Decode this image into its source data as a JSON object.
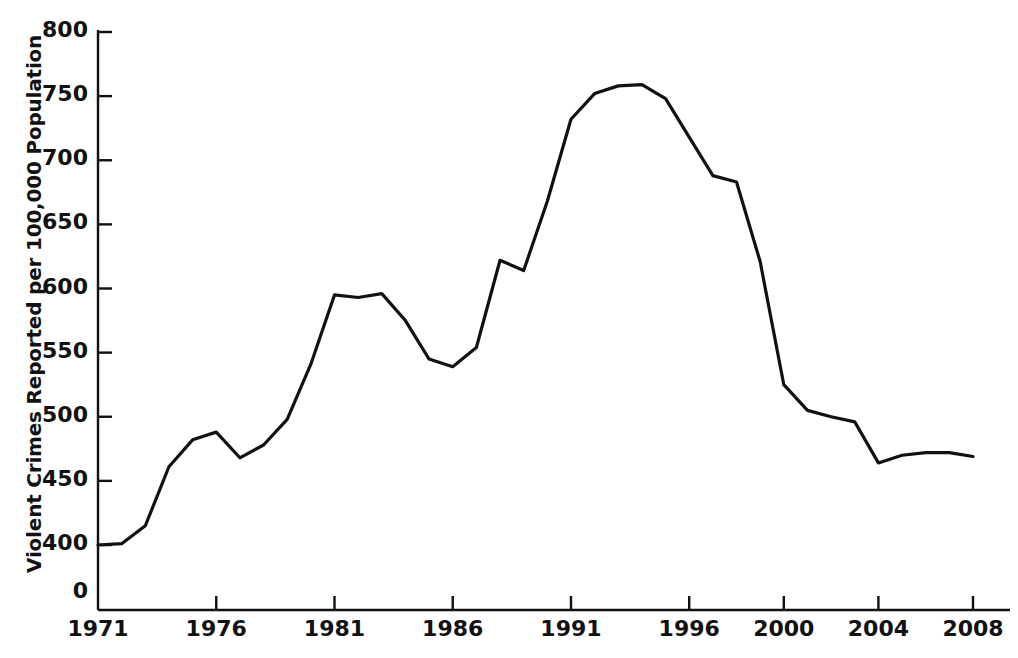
{
  "chart_data": {
    "type": "line",
    "title": "",
    "subtitle": "",
    "xlabel": "",
    "ylabel": "Violent Crimes Reported per 100,000 Population",
    "xlim": [
      1971,
      2008
    ],
    "ylim": [
      400,
      800
    ],
    "y_axis_has_zero_break": true,
    "y_zero_label": "0",
    "yticks": [
      400,
      450,
      500,
      550,
      600,
      650,
      700,
      750,
      800
    ],
    "ytick_labels": [
      "400",
      "450",
      "500",
      "550",
      "600",
      "650",
      "700",
      "750",
      "800"
    ],
    "xticks": [
      1971,
      1976,
      1981,
      1986,
      1991,
      1996,
      2000,
      2004,
      2008
    ],
    "xtick_labels": [
      "1971",
      "1976",
      "1981",
      "1986",
      "1991",
      "1996",
      "2000",
      "2004",
      "2008"
    ],
    "grid": false,
    "legend": false,
    "legend_position": "none",
    "line_color": "#111111",
    "line_width": 3.2,
    "axis_color": "#111111",
    "background_color": "#ffffff",
    "x": [
      1971,
      1972,
      1973,
      1974,
      1975,
      1976,
      1977,
      1978,
      1979,
      1980,
      1981,
      1982,
      1983,
      1984,
      1985,
      1986,
      1987,
      1988,
      1989,
      1990,
      1991,
      1992,
      1993,
      1994,
      1995,
      1996,
      1997,
      1998,
      1999,
      2000,
      2001,
      2002,
      2003,
      2004,
      2005,
      2006,
      2007,
      2008
    ],
    "values": [
      400,
      401,
      415,
      461,
      482,
      488,
      468,
      478,
      498,
      541,
      595,
      593,
      596,
      575,
      545,
      539,
      554,
      622,
      614,
      668,
      732,
      752,
      758,
      759,
      748,
      718,
      688,
      683,
      621,
      525,
      505,
      500,
      496,
      464,
      470,
      472,
      472,
      469
    ],
    "series": [
      {
        "name": "Violent crime rate",
        "values": [
          400,
          401,
          415,
          461,
          482,
          488,
          468,
          478,
          498,
          541,
          595,
          593,
          596,
          575,
          545,
          539,
          554,
          622,
          614,
          668,
          732,
          752,
          758,
          759,
          748,
          718,
          688,
          683,
          621,
          525,
          505,
          500,
          496,
          464,
          470,
          472,
          472,
          469
        ]
      }
    ]
  },
  "axes": {
    "ylabel": "Violent Crimes Reported per 100,000 Population"
  }
}
